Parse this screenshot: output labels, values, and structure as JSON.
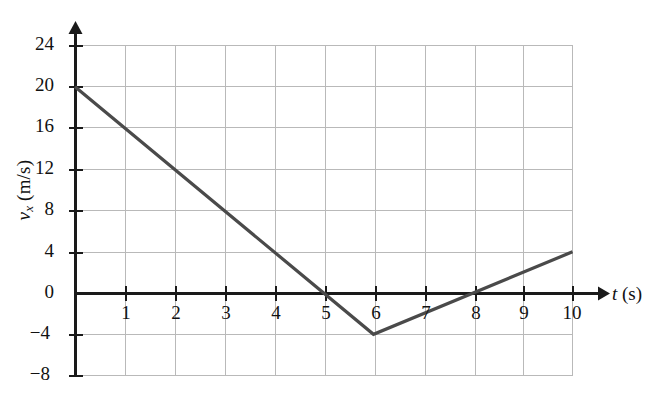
{
  "chart_data": {
    "type": "line",
    "title": "",
    "xlabel": "t (s)",
    "ylabel": "v_x (m/s)",
    "xlabel_var": "t",
    "xlabel_unit": "(s)",
    "ylabel_var": "v",
    "ylabel_sub": "x",
    "ylabel_unit": "(m/s)",
    "xlim": [
      0,
      10
    ],
    "ylim": [
      -8,
      24
    ],
    "grid": true,
    "legend": "none",
    "xticks": [
      1,
      2,
      3,
      4,
      5,
      6,
      7,
      8,
      9,
      10
    ],
    "xtick_labels": [
      "1",
      "2",
      "3",
      "4",
      "5",
      "6",
      "7",
      "8",
      "9",
      "10"
    ],
    "yticks": [
      24,
      20,
      16,
      12,
      8,
      4,
      0,
      -4,
      -8
    ],
    "ytick_labels": [
      "24",
      "20",
      "16",
      "12",
      "8",
      "4",
      "0",
      "−4",
      "−8"
    ],
    "series": [
      {
        "name": "v_x",
        "x": [
          0,
          6,
          10
        ],
        "values": [
          20,
          -4,
          4
        ],
        "color": "#4a4a4a"
      }
    ],
    "annotations": {
      "zero_crossings": [
        5,
        8
      ],
      "minimum": {
        "x": 6,
        "y": -4
      },
      "start": {
        "x": 0,
        "y": 20
      },
      "end": {
        "x": 10,
        "y": 4
      }
    },
    "colors": {
      "curve": "#4a4a4a",
      "grid": "#b9b9b9",
      "axis": "#1a1a1a",
      "text": "#111111",
      "background": "#ffffff"
    }
  }
}
